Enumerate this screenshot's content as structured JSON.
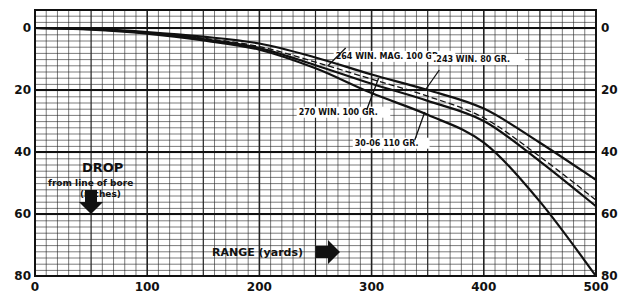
{
  "chart_data": {
    "type": "line",
    "title": "",
    "xlabel": "RANGE (yards)",
    "ylabel": "DROP from line of bore (inches)",
    "xlim": [
      0,
      500
    ],
    "ylim": [
      0,
      80
    ],
    "y_inverted": true,
    "x_ticks": [
      0,
      100,
      200,
      300,
      400,
      500
    ],
    "y_ticks": [
      0,
      20,
      40,
      60,
      80
    ],
    "grid": true,
    "x": [
      0,
      50,
      100,
      150,
      200,
      250,
      300,
      350,
      400,
      450,
      500
    ],
    "series": [
      {
        "name": "264 WIN. MAG. 100 GR.",
        "style": "solid",
        "values": [
          0,
          0.3,
          1.3,
          2.8,
          5,
          9.5,
          15,
          20,
          26,
          37,
          49
        ]
      },
      {
        "name": ".243 WIN. 80 GR.",
        "style": "dashed",
        "values": [
          0,
          0.4,
          1.5,
          3.3,
          6,
          11,
          16.5,
          22,
          29,
          41.5,
          55.5
        ]
      },
      {
        "name": "270 WIN. 100 GR.",
        "style": "solid",
        "values": [
          0,
          0.4,
          1.6,
          3.6,
          6.5,
          12,
          18,
          23.5,
          30,
          43,
          57.5
        ]
      },
      {
        "name": "30-06 110 GR.",
        "style": "solid",
        "values": [
          0,
          0.5,
          1.8,
          4,
          7,
          13,
          21,
          28,
          37,
          56,
          80
        ]
      }
    ],
    "annotations": [
      {
        "text": "264 WIN. MAG. 100 GR.",
        "x": 268,
        "y": 9
      },
      {
        "text": ".243 WIN. 80 GR.",
        "x": 355,
        "y": 10
      },
      {
        "text": "270 WIN. 100 GR.",
        "x": 235,
        "y": 27
      },
      {
        "text": "30-06 110 GR.",
        "x": 285,
        "y": 37
      }
    ]
  },
  "labels": {
    "drop_title": "DROP",
    "drop_sub1": "from line of bore",
    "drop_sub2": "(inches)",
    "range": "RANGE (yards)"
  }
}
